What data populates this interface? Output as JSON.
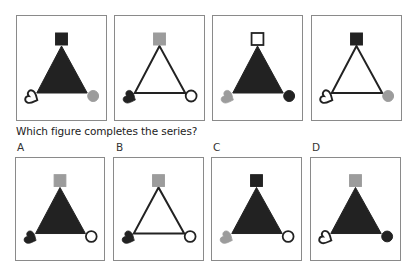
{
  "colors": {
    "dark": "#222222",
    "gray": "#9c9c9c",
    "white": "#ffffff",
    "border": "#8a8a8a"
  },
  "question": "Which figure completes the series?",
  "series": [
    {
      "id": "series-1",
      "triangle": "filled",
      "top_square": "dark",
      "left_heart": "outline",
      "right_circle": "gray"
    },
    {
      "id": "series-2",
      "triangle": "outline",
      "top_square": "gray",
      "left_heart": "dark",
      "right_circle": "outline"
    },
    {
      "id": "series-3",
      "triangle": "filled",
      "top_square": "outline",
      "left_heart": "gray",
      "right_circle": "dark"
    },
    {
      "id": "series-4",
      "triangle": "outline",
      "top_square": "dark",
      "left_heart": "outline",
      "right_circle": "gray"
    }
  ],
  "options": [
    {
      "label": "A",
      "triangle": "filled",
      "top_square": "gray",
      "left_heart": "dark",
      "right_circle": "outline"
    },
    {
      "label": "B",
      "triangle": "outline",
      "top_square": "gray",
      "left_heart": "dark",
      "right_circle": "outline"
    },
    {
      "label": "C",
      "triangle": "filled",
      "top_square": "dark",
      "left_heart": "gray",
      "right_circle": "outline"
    },
    {
      "label": "D",
      "triangle": "filled",
      "top_square": "gray",
      "left_heart": "outline",
      "right_circle": "dark"
    }
  ]
}
